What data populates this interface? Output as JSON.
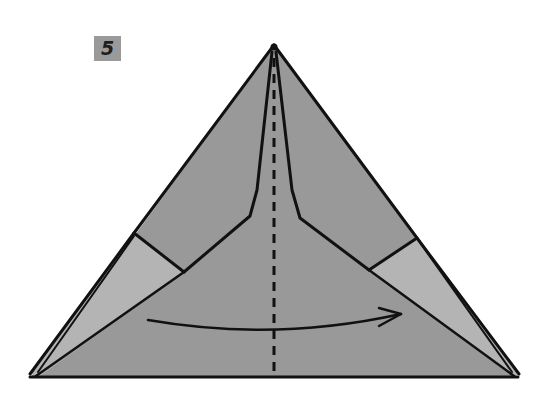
{
  "step": {
    "number": "5"
  },
  "diagram": {
    "instruction": "valley fold in half along the center line, left to right",
    "colors": {
      "paper_main": "#999999",
      "paper_light": "#b4b4b4",
      "line": "#111111",
      "background": "#ffffff",
      "badge": "#9a9a9a"
    },
    "elements": [
      {
        "type": "outline",
        "name": "outer-triangle"
      },
      {
        "type": "flap",
        "name": "left-flap"
      },
      {
        "type": "flap",
        "name": "right-flap"
      },
      {
        "type": "valley-fold-line",
        "name": "center-dashed-line"
      },
      {
        "type": "arrow",
        "name": "fold-arrow",
        "direction": "left-to-right"
      }
    ]
  }
}
